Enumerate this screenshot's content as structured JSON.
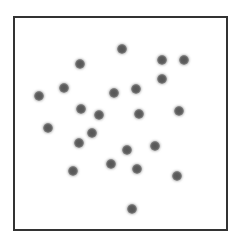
{
  "chart_data": {
    "type": "scatter",
    "title": "",
    "xlabel": "",
    "ylabel": "",
    "grid": false,
    "legend": null,
    "coordinate_space": "pixel",
    "frame": {
      "x": 13,
      "y": 16,
      "width": 213,
      "height": 213,
      "border_color": "#333333"
    },
    "marker": {
      "shape": "circle",
      "diameter": 10,
      "color": "#5a5a5a",
      "halo_color": "#a8a8a8"
    },
    "points": [
      {
        "x": 122,
        "y": 49
      },
      {
        "x": 162,
        "y": 60
      },
      {
        "x": 184,
        "y": 60
      },
      {
        "x": 80,
        "y": 64
      },
      {
        "x": 162,
        "y": 79
      },
      {
        "x": 64,
        "y": 88
      },
      {
        "x": 39,
        "y": 96
      },
      {
        "x": 114,
        "y": 93
      },
      {
        "x": 136,
        "y": 89
      },
      {
        "x": 81,
        "y": 109
      },
      {
        "x": 99,
        "y": 115
      },
      {
        "x": 139,
        "y": 114
      },
      {
        "x": 179,
        "y": 111
      },
      {
        "x": 48,
        "y": 128
      },
      {
        "x": 92,
        "y": 133
      },
      {
        "x": 79,
        "y": 143
      },
      {
        "x": 127,
        "y": 150
      },
      {
        "x": 155,
        "y": 146
      },
      {
        "x": 111,
        "y": 164
      },
      {
        "x": 137,
        "y": 169
      },
      {
        "x": 73,
        "y": 171
      },
      {
        "x": 177,
        "y": 176
      },
      {
        "x": 132,
        "y": 209
      }
    ],
    "point_count": 23
  }
}
